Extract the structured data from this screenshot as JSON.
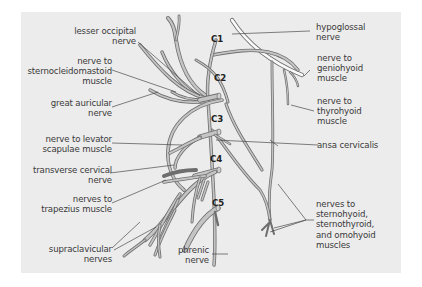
{
  "figure": {
    "background": "#ececec",
    "nerve_color": "#bfbfbf",
    "nerve_outline": "#6e6e6e",
    "leader_color": "#444444",
    "root_labels": [
      "C1",
      "C2",
      "C3",
      "C4",
      "C5"
    ],
    "left_labels": [
      {
        "lines": [
          "lesser occipital",
          "nerve"
        ]
      },
      {
        "lines": [
          "nerve to",
          "sternocleidomastoid",
          "muscle"
        ]
      },
      {
        "lines": [
          "great auricular",
          "nerve"
        ]
      },
      {
        "lines": [
          "nerve to levator",
          "scapulae muscle"
        ]
      },
      {
        "lines": [
          "transverse cervical",
          "nerve"
        ]
      },
      {
        "lines": [
          "nerves to",
          "trapezius muscle"
        ]
      },
      {
        "lines": [
          "supraclavicular",
          "nerves"
        ]
      }
    ],
    "bottom_label": {
      "lines": [
        "phrenic",
        "nerve"
      ]
    },
    "right_labels": [
      {
        "lines": [
          "hypoglossal",
          "nerve"
        ]
      },
      {
        "lines": [
          "nerve to",
          "geniohyoid",
          "muscle"
        ]
      },
      {
        "lines": [
          "nerve to",
          "thyrohyoid",
          "muscle"
        ]
      },
      {
        "lines": [
          "ansa cervicalis"
        ]
      },
      {
        "lines": [
          "nerves to",
          "sternohyoid,",
          "sternothyroid,",
          "and omohyoid",
          "muscles"
        ]
      }
    ]
  }
}
